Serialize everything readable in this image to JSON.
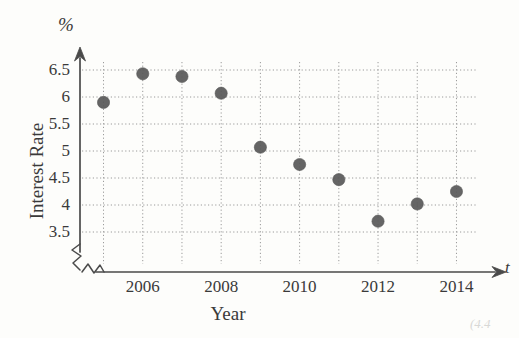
{
  "chart_data": {
    "type": "scatter",
    "title": "",
    "xlabel": "Year",
    "ylabel": "Interest Rate",
    "y_unit_symbol": "%",
    "x_axis_variable": "t",
    "x": [
      2005,
      2006,
      2007,
      2008,
      2009,
      2010,
      2011,
      2012,
      2013,
      2014
    ],
    "values": [
      5.9,
      6.43,
      6.38,
      6.07,
      5.07,
      4.75,
      4.47,
      3.7,
      4.02,
      4.25
    ],
    "series": [
      {
        "name": "Interest Rate",
        "values": [
          5.9,
          6.43,
          6.38,
          6.07,
          5.07,
          4.75,
          4.47,
          3.7,
          4.02,
          4.25
        ]
      }
    ],
    "xlim": [
      2004.4,
      2014.6
    ],
    "ylim": [
      3.35,
      6.72
    ],
    "xticks": [
      2006,
      2008,
      2010,
      2012,
      2014
    ],
    "xtick_labels": [
      "2006",
      "2008",
      "2010",
      "2012",
      "2014"
    ],
    "yticks": [
      3.5,
      4,
      4.5,
      5,
      5.5,
      6,
      6.5
    ],
    "ytick_labels": [
      "3.5",
      "4",
      "4.5",
      "5",
      "5.5",
      "6",
      "6.5"
    ],
    "gridlines_x": [
      2005,
      2006,
      2007,
      2008,
      2009,
      2010,
      2011,
      2012,
      2013,
      2014
    ],
    "grid": true,
    "grid_style": "dotted",
    "legend": "none",
    "axis_break_x": true,
    "axis_break_y": true,
    "marker": "filled-circle",
    "marker_color": "#5a5a5a",
    "grid_color": "#9a9a9a",
    "axis_color": "#4a4a4a",
    "text_color": "#3a3a3a",
    "background_color": "#fdfdfb"
  },
  "annotations": {
    "corner_artifact": "(4.4"
  }
}
